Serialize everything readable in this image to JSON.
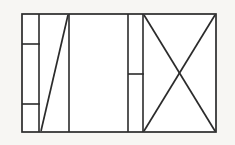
{
  "figure": {
    "title": "Rectangular panel line diagram",
    "background_color": "#f7f6f3",
    "stroke_color": "#2b2b2b",
    "fill_color": "#ffffff",
    "stroke_width": 1.6,
    "canvas": {
      "width": 235,
      "height": 145
    }
  },
  "geometry": {
    "outer_rect": {
      "x": 22,
      "y": 14,
      "width": 194,
      "height": 118,
      "label": "outer boundary"
    },
    "vertical_dividers": [
      {
        "name": "divider-1",
        "x": 39,
        "y1": 14,
        "y2": 132
      },
      {
        "name": "divider-2",
        "x": 69,
        "y1": 14,
        "y2": 132
      },
      {
        "name": "divider-3",
        "x": 128,
        "y1": 14,
        "y2": 132
      },
      {
        "name": "divider-4",
        "x": 143,
        "y1": 14,
        "y2": 132
      }
    ],
    "horizontal_dividers": [
      {
        "name": "left-column-upper-divider",
        "y": 44,
        "x1": 22,
        "x2": 39
      },
      {
        "name": "left-column-lower-divider",
        "y": 104,
        "x1": 22,
        "x2": 39
      },
      {
        "name": "mid-column-divider",
        "y": 74,
        "x1": 128,
        "x2": 143
      }
    ],
    "diagonals": [
      {
        "name": "panel-2-rising-diagonal",
        "x1": 41,
        "y1": 131,
        "x2": 68,
        "y2": 15
      },
      {
        "name": "panel-5-diagonal-falling",
        "x1": 144,
        "y1": 15,
        "x2": 215,
        "y2": 131
      },
      {
        "name": "panel-5-diagonal-rising",
        "x1": 144,
        "y1": 131,
        "x2": 215,
        "y2": 15
      }
    ],
    "x_crossing_point": {
      "x": 180,
      "y": 73
    }
  },
  "panels": [
    {
      "name": "panel-narrow-left",
      "cells": 3,
      "contents": "three stacked cells"
    },
    {
      "name": "panel-diagonal",
      "cells": 1,
      "contents": "single rising diagonal"
    },
    {
      "name": "panel-blank",
      "cells": 1,
      "contents": "empty"
    },
    {
      "name": "panel-narrow-mid",
      "cells": 2,
      "contents": "two stacked cells"
    },
    {
      "name": "panel-cross",
      "cells": 1,
      "contents": "crossed diagonals forming an X"
    }
  ]
}
